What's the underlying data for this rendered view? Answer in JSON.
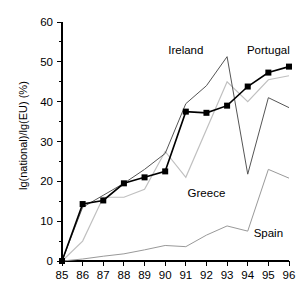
{
  "chart_data": {
    "type": "line",
    "title": "",
    "xlabel": "",
    "ylabel": "lg(national)/lg(EU) (%)",
    "x": [
      "85",
      "86",
      "87",
      "88",
      "89",
      "90",
      "91",
      "92",
      "93",
      "94",
      "95",
      "96"
    ],
    "xlim": [
      85,
      96
    ],
    "ylim": [
      0,
      60
    ],
    "yticks": [
      0,
      10,
      20,
      30,
      40,
      50,
      60
    ],
    "ytick_labels": [
      "0",
      "10",
      "20",
      "30",
      "40",
      "50",
      "60"
    ],
    "minor_yticks": [
      5,
      15,
      25,
      35,
      45,
      55
    ],
    "grid": false,
    "legend": "inline-annotations",
    "series": [
      {
        "name": "Ireland",
        "color": "#555555",
        "marker": "none",
        "line_width": 1.0,
        "label_x": "91",
        "label_y": 52,
        "values": [
          0,
          13.5,
          16.5,
          19.5,
          23.0,
          27.0,
          39.5,
          44.0,
          51.3,
          21.8,
          41.0,
          38.5
        ]
      },
      {
        "name": "Portugal",
        "color": "#000000",
        "marker": "filled-square",
        "line_width": 1.6,
        "label_x": "95",
        "label_y": 52,
        "values": [
          0,
          14.3,
          15.2,
          19.5,
          21.0,
          22.5,
          37.5,
          37.2,
          39.0,
          43.8,
          47.3,
          48.8
        ]
      },
      {
        "name": "Greece",
        "color": "#c0c0c0",
        "marker": "none",
        "line_width": 1.2,
        "label_x": "92",
        "label_y": 16,
        "values": [
          0,
          5.0,
          16.0,
          16.0,
          18.0,
          27.5,
          21.0,
          33.0,
          45.0,
          40.0,
          45.5,
          46.5
        ]
      },
      {
        "name": "Spain",
        "color": "#999999",
        "marker": "none",
        "line_width": 1.0,
        "label_x": "95",
        "label_y": 6,
        "values": [
          0,
          0.5,
          1.2,
          1.8,
          2.8,
          3.9,
          3.6,
          6.5,
          8.8,
          7.5,
          23.0,
          20.8
        ]
      }
    ]
  },
  "axis": {
    "y_title": "lg(national)/lg(EU) (%)"
  },
  "labels": {
    "ireland": "Ireland",
    "portugal": "Portugal",
    "greece": "Greece",
    "spain": "Spain"
  }
}
